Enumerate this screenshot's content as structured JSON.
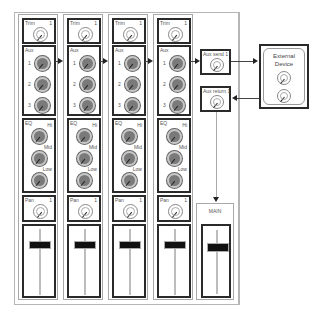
{
  "diagram": {
    "type": "mixer-aux-send-return-signal-flow",
    "colors": {
      "box_border": "#2a2a2a",
      "strip_border": "#a8a8a8",
      "knob_fill": "#7a7a7a",
      "fader_cap": "#111111"
    }
  },
  "channels": [
    {
      "trim_label": "Trim",
      "channel_number": "1",
      "aux_label": "Aux",
      "aux_knobs": [
        "1",
        "2",
        "3"
      ],
      "eq_label": "EQ",
      "eq_bands": [
        "Hi",
        "Mid",
        "Low"
      ],
      "pan_label": "Pan",
      "pan_number": "1"
    },
    {
      "trim_label": "Trim",
      "channel_number": "1",
      "aux_label": "Aux",
      "aux_knobs": [
        "1",
        "2",
        "3"
      ],
      "eq_label": "EQ",
      "eq_bands": [
        "Hi",
        "Mid",
        "Low"
      ],
      "pan_label": "Pan",
      "pan_number": "1"
    },
    {
      "trim_label": "Trim",
      "channel_number": "1",
      "aux_label": "Aux",
      "aux_knobs": [
        "1",
        "2",
        "3"
      ],
      "eq_label": "EQ",
      "eq_bands": [
        "Hi",
        "Mid",
        "Low"
      ],
      "pan_label": "Pan",
      "pan_number": "1"
    },
    {
      "trim_label": "Trim",
      "channel_number": "1",
      "aux_label": "Aux",
      "aux_knobs": [
        "1",
        "2",
        "3"
      ],
      "eq_label": "EQ",
      "eq_bands": [
        "Hi",
        "Mid",
        "Low"
      ],
      "pan_label": "Pan",
      "pan_number": "1"
    }
  ],
  "aux_send": {
    "label": "Aux send 1"
  },
  "aux_return": {
    "label": "Aux return 1"
  },
  "main": {
    "label": "MAIN"
  },
  "external_device": {
    "title_line1": "External",
    "title_line2": "Device"
  }
}
